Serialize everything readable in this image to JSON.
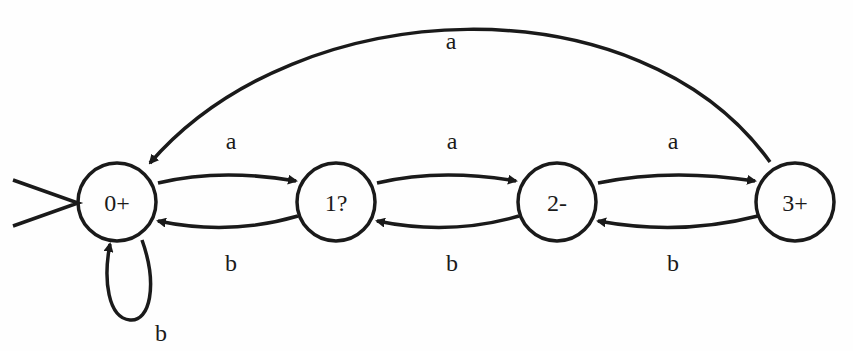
{
  "diagram": {
    "type": "finite-automaton",
    "states": [
      {
        "id": "s0",
        "label": "0+",
        "initial": true
      },
      {
        "id": "s1",
        "label": "1?"
      },
      {
        "id": "s2",
        "label": "2-"
      },
      {
        "id": "s3",
        "label": "3+"
      }
    ],
    "transitions": [
      {
        "from": "0+",
        "to": "1?",
        "label": "a"
      },
      {
        "from": "1?",
        "to": "0+",
        "label": "b"
      },
      {
        "from": "1?",
        "to": "2-",
        "label": "a"
      },
      {
        "from": "2-",
        "to": "1?",
        "label": "b"
      },
      {
        "from": "2-",
        "to": "3+",
        "label": "a"
      },
      {
        "from": "3+",
        "to": "2-",
        "label": "b"
      },
      {
        "from": "3+",
        "to": "0+",
        "label": "a"
      },
      {
        "from": "0+",
        "to": "0+",
        "label": "b"
      }
    ],
    "colors": {
      "stroke": "#1a1a1a",
      "background": "#fefefe"
    }
  }
}
